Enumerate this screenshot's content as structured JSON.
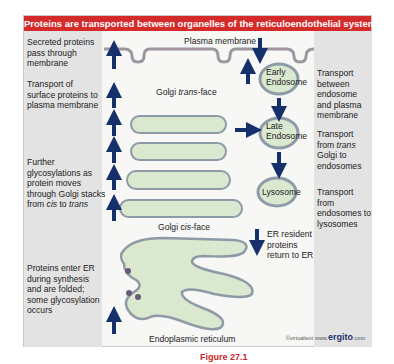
{
  "figure": {
    "title": "Proteins are transported between organelles of the reticuloendothelial system",
    "colors": {
      "title_bar": "#d42a2a",
      "arrow": "#15306b",
      "organelle_fill": "#d9e8cf",
      "organelle_outline": "#8e9aa6",
      "side_panel": "#e3e3e3"
    },
    "left_labels": [
      {
        "id": "secreted",
        "text": "Secreted proteins pass through membrane"
      },
      {
        "id": "surface",
        "text": "Transport of surface proteins to plasma membrane"
      },
      {
        "id": "glyco",
        "text_parts": [
          "Further glycosylations as protein moves through Golgi stacks from ",
          "cis",
          " to ",
          "trans"
        ]
      },
      {
        "id": "er-enter",
        "text": "Proteins enter ER during synthesis and are folded; some glycosylation occurs"
      }
    ],
    "right_labels": [
      {
        "id": "endo-pm",
        "text": "Transport between endosome and plasma membrane"
      },
      {
        "id": "golgi-endo",
        "text_parts": [
          "Transport from ",
          "trans",
          " Golgi to endosomes"
        ]
      },
      {
        "id": "endo-lyso",
        "text": "Transport from endosomes to lysosomes"
      }
    ],
    "structures": {
      "plasma_membrane": "Plasma membrane",
      "golgi_trans": {
        "prefix": "Golgi ",
        "italic": "trans",
        "suffix": "-face"
      },
      "golgi_cis": {
        "prefix": "Golgi ",
        "italic": "cis",
        "suffix": "-face"
      },
      "early_endosome": [
        "Early",
        "Endosome"
      ],
      "late_endosome": [
        "Late",
        "Endosome"
      ],
      "lysosome": "Lysosome",
      "er": "Endoplasmic reticulum",
      "er_return": "ER resident proteins return to ER"
    },
    "credit": {
      "copyright": "©virtualtext",
      "site_prefix": "www.",
      "site_bold": "ergito",
      "site_suffix": ".com"
    }
  },
  "caption": {
    "label": "Figure",
    "number": "27.1"
  }
}
